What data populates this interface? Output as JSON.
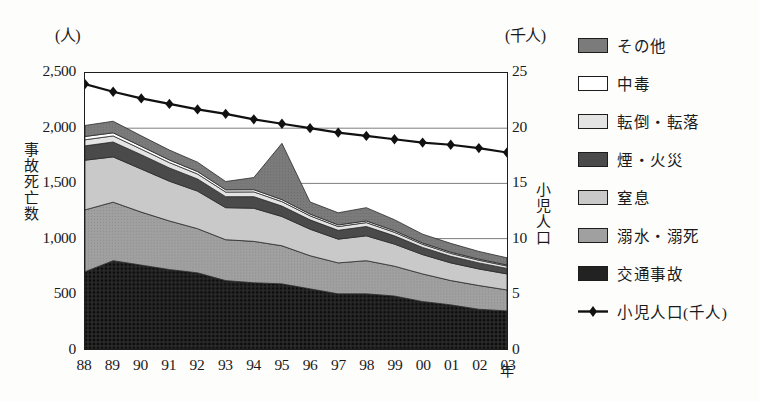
{
  "axes": {
    "left_unit": "(人)",
    "right_unit": "(千人)",
    "left_title": "事故死亡数",
    "right_title": "小児人口",
    "x_unit": "年",
    "left_ticks": [
      "2,500",
      "2,000",
      "1,500",
      "1,000",
      "500",
      "0"
    ],
    "right_ticks": [
      "25",
      "20",
      "15",
      "10",
      "5",
      "0"
    ],
    "x_ticks": [
      "88",
      "89",
      "90",
      "91",
      "92",
      "93",
      "94",
      "95",
      "96",
      "97",
      "98",
      "99",
      "00",
      "01",
      "02",
      "03"
    ]
  },
  "legend": {
    "items": [
      {
        "label": "その他",
        "color": "#7b7b7b",
        "kind": "swatch"
      },
      {
        "label": "中毒",
        "color": "#ffffff",
        "kind": "swatch"
      },
      {
        "label": "転倒・転落",
        "color": "#e4e4e4",
        "kind": "swatch"
      },
      {
        "label": "煙・火災",
        "color": "#4a4a4a",
        "kind": "swatch"
      },
      {
        "label": "窒息",
        "color": "#c9c9c9",
        "kind": "swatch"
      },
      {
        "label": "溺水・溺死",
        "color": "#a0a0a0",
        "kind": "swatch"
      },
      {
        "label": "交通事故",
        "color": "#222222",
        "kind": "swatch"
      },
      {
        "label": "小児人口(千人)",
        "color": "#111111",
        "kind": "line-marker"
      }
    ]
  },
  "chart_data": {
    "type": "area",
    "title": "",
    "xlabel": "年",
    "ylabel": "事故死亡数",
    "y2label": "小児人口",
    "categories": [
      "88",
      "89",
      "90",
      "91",
      "92",
      "93",
      "94",
      "95",
      "96",
      "97",
      "98",
      "99",
      "00",
      "01",
      "02",
      "03"
    ],
    "ylim": [
      0,
      2500
    ],
    "y2lim": [
      0,
      25
    ],
    "grid": true,
    "stacked": true,
    "stack_order_bottom_to_top": [
      "交通事故",
      "溺水・溺死",
      "窒息",
      "煙・火災",
      "転倒・転落",
      "中毒",
      "その他"
    ],
    "series": [
      {
        "name": "交通事故",
        "color": "#222222",
        "values": [
          700,
          800,
          760,
          720,
          690,
          620,
          600,
          590,
          545,
          500,
          500,
          480,
          430,
          400,
          360,
          345
        ]
      },
      {
        "name": "溺水・溺死",
        "color": "#a0a0a0",
        "values": [
          560,
          530,
          480,
          440,
          400,
          370,
          375,
          345,
          300,
          280,
          300,
          270,
          250,
          220,
          215,
          190
        ]
      },
      {
        "name": "窒息",
        "color": "#c9c9c9",
        "values": [
          450,
          410,
          390,
          360,
          340,
          290,
          300,
          265,
          240,
          215,
          225,
          200,
          175,
          160,
          150,
          145
        ]
      },
      {
        "name": "煙・火災",
        "color": "#4a4a4a",
        "values": [
          130,
          135,
          130,
          120,
          110,
          100,
          105,
          95,
          85,
          80,
          85,
          75,
          65,
          60,
          55,
          50
        ]
      },
      {
        "name": "転倒・転落",
        "color": "#e4e4e4",
        "values": [
          55,
          55,
          50,
          48,
          45,
          42,
          43,
          40,
          36,
          34,
          35,
          32,
          28,
          26,
          24,
          22
        ]
      },
      {
        "name": "中毒",
        "color": "#ffffff",
        "values": [
          30,
          28,
          26,
          24,
          22,
          20,
          20,
          18,
          16,
          15,
          15,
          14,
          12,
          11,
          10,
          9
        ]
      },
      {
        "name": "その他",
        "color": "#7b7b7b",
        "values": [
          100,
          105,
          95,
          90,
          85,
          75,
          110,
          510,
          110,
          110,
          120,
          100,
          80,
          80,
          70,
          65
        ]
      }
    ],
    "secondary_series": {
      "name": "小児人口(千人)",
      "color": "#111111",
      "marker": "diamond",
      "unit": "千人",
      "values": [
        24.0,
        23.3,
        22.7,
        22.2,
        21.7,
        21.3,
        20.8,
        20.4,
        20.0,
        19.6,
        19.3,
        19.0,
        18.7,
        18.5,
        18.2,
        17.8
      ]
    }
  }
}
